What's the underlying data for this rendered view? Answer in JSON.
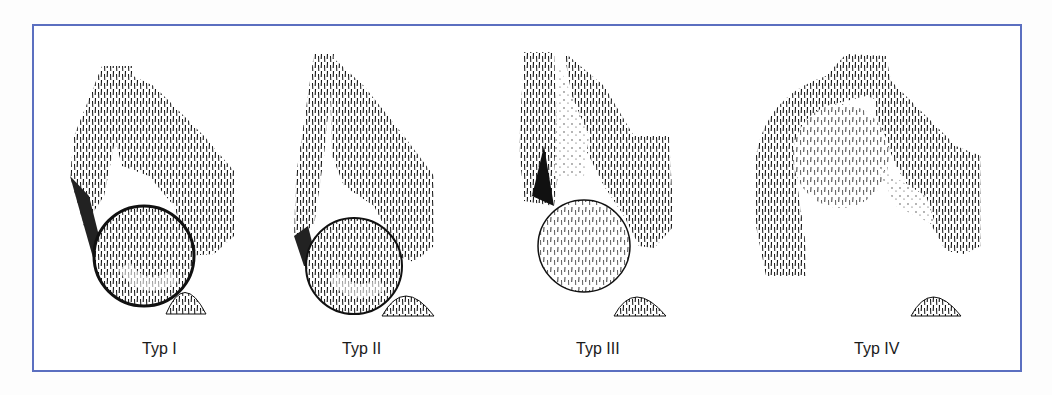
{
  "figure": {
    "border_color": "#5b6fc0",
    "panels": [
      {
        "label": "Typ I"
      },
      {
        "label": "Typ II"
      },
      {
        "label": "Typ III"
      },
      {
        "label": "Typ IV"
      }
    ]
  }
}
